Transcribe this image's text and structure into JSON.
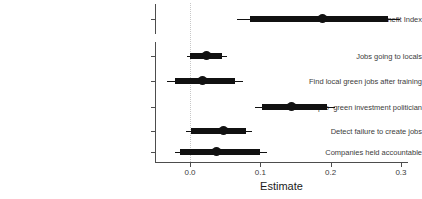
{
  "chart_data": {
    "type": "scatter",
    "plot_style": "coefficient-forest-plot",
    "title": "",
    "xlabel": "Estimate",
    "ylabel": "",
    "xlim": [
      -0.043,
      0.31
    ],
    "xticks": [
      0.0,
      0.1,
      0.2,
      0.3
    ],
    "xticklabels": [
      "0.0",
      "0.1",
      "0.2",
      "0.3"
    ],
    "grid": false,
    "legend": null,
    "reference_line": {
      "value": 0.0,
      "style": "dotted",
      "color": "#c8c8c8"
    },
    "point_color": "#111111",
    "facets": [
      {
        "name": "index-facet",
        "categories": [
          "Local Benefit Index"
        ],
        "points": [
          {
            "label": "Local Benefit Index",
            "estimate": 0.188,
            "inner_low": 0.085,
            "inner_high": 0.282,
            "outer_low": 0.067,
            "outer_high": 0.299
          }
        ]
      },
      {
        "name": "items-facet",
        "categories": [
          "Jobs going to locals",
          "Find local green jobs after training",
          "Vote for pro−green investment politician",
          "Detect failure to create jobs",
          "Companies held accountable"
        ],
        "points": [
          {
            "label": "Jobs going to locals",
            "estimate": 0.024,
            "inner_low": 0.0,
            "inner_high": 0.046,
            "outer_low": -0.004,
            "outer_high": 0.053
          },
          {
            "label": "Find local green jobs after training",
            "estimate": 0.018,
            "inner_low": -0.021,
            "inner_high": 0.064,
            "outer_low": -0.033,
            "outer_high": 0.075
          },
          {
            "label": "Vote for pro−green investment politician",
            "estimate": 0.145,
            "inner_low": 0.102,
            "inner_high": 0.195,
            "outer_low": 0.092,
            "outer_high": 0.206
          },
          {
            "label": "Detect failure to create jobs",
            "estimate": 0.047,
            "inner_low": 0.001,
            "inner_high": 0.08,
            "outer_low": -0.006,
            "outer_high": 0.088
          },
          {
            "label": "Companies held accountable",
            "estimate": 0.038,
            "inner_low": -0.014,
            "inner_high": 0.1,
            "outer_low": -0.021,
            "outer_high": 0.11
          }
        ]
      }
    ]
  },
  "axis": {
    "x_title": "Estimate",
    "tick_0": "0.0",
    "tick_1": "0.1",
    "tick_2": "0.2",
    "tick_3": "0.3"
  },
  "rows": {
    "r0": "Local Benefit Index",
    "r1": "Jobs going to locals",
    "r2": "Find local green jobs after training",
    "r3": "Vote for pro−green investment politician",
    "r4": "Detect failure to create jobs",
    "r5": "Companies held accountable"
  }
}
